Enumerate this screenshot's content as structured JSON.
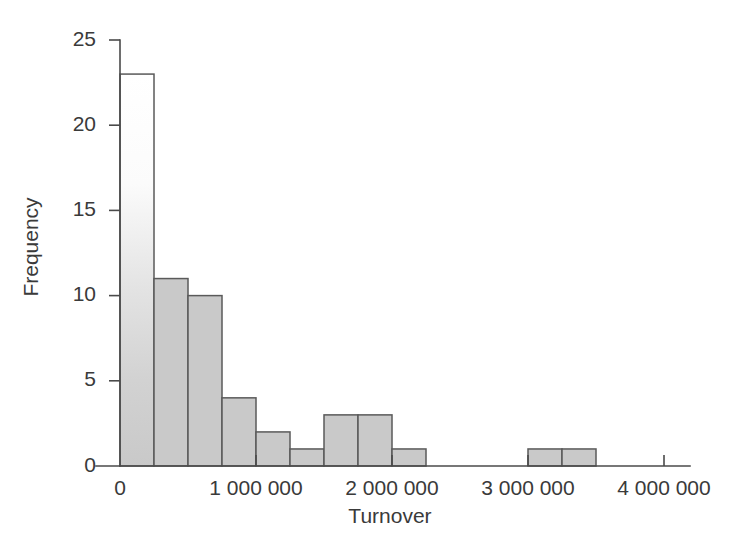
{
  "chart_data": {
    "type": "bar",
    "title": "",
    "subtitle": "",
    "xlabel": "Turnover",
    "ylabel": "Frequency",
    "xlim": [
      -180000,
      4250000
    ],
    "ylim": [
      0,
      25
    ],
    "grid": false,
    "legend": false,
    "legend_position": "none",
    "bin_width": 250000,
    "bin_edges": [
      0,
      250000,
      500000,
      750000,
      1000000,
      1250000,
      1500000,
      1750000,
      2000000,
      2250000,
      3000000,
      3250000,
      3500000
    ],
    "bins": [
      {
        "x0": 0,
        "x1": 250000,
        "frequency": 23
      },
      {
        "x0": 250000,
        "x1": 500000,
        "frequency": 11
      },
      {
        "x0": 500000,
        "x1": 750000,
        "frequency": 10
      },
      {
        "x0": 750000,
        "x1": 1000000,
        "frequency": 4
      },
      {
        "x0": 1000000,
        "x1": 1250000,
        "frequency": 2
      },
      {
        "x0": 1250000,
        "x1": 1500000,
        "frequency": 1
      },
      {
        "x0": 1500000,
        "x1": 1750000,
        "frequency": 3
      },
      {
        "x0": 1750000,
        "x1": 2000000,
        "frequency": 3
      },
      {
        "x0": 2000000,
        "x1": 2250000,
        "frequency": 1
      },
      {
        "x0": 3000000,
        "x1": 3250000,
        "frequency": 1
      },
      {
        "x0": 3250000,
        "x1": 3500000,
        "frequency": 1
      }
    ],
    "values": [
      23,
      11,
      10,
      4,
      2,
      1,
      3,
      3,
      1,
      1,
      1
    ],
    "categories": [
      "0-250k",
      "250k-500k",
      "500k-750k",
      "750k-1M",
      "1M-1.25M",
      "1.25M-1.5M",
      "1.5M-1.75M",
      "1.75M-2M",
      "2M-2.25M",
      "3M-3.25M",
      "3.25M-3.5M"
    ],
    "yticks": [
      0,
      5,
      10,
      15,
      20,
      25
    ],
    "ytick_labels": [
      "0",
      "5",
      "10",
      "15",
      "20",
      "25"
    ],
    "xticks": [
      0,
      1000000,
      2000000,
      3000000,
      4000000
    ],
    "xtick_labels": [
      "0",
      "1 000 000",
      "2 000 000",
      "3 000 000",
      "4 000 000"
    ],
    "total_count": 60,
    "colors": {
      "bar_fill": "#c9c9c9",
      "bar_fill_top": "#ffffff",
      "bar_stroke": "#5a5a5a",
      "axis": "#4a4a4a",
      "text": "#3a3a3a",
      "background": "#ffffff"
    }
  }
}
